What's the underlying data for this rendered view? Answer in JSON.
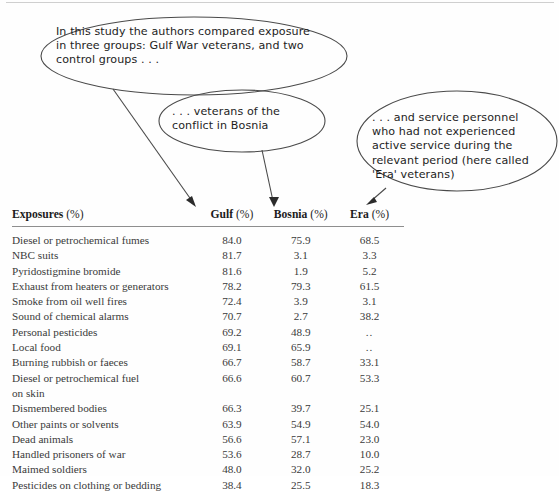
{
  "callouts": [
    {
      "id": "callout-1",
      "name": "callout-gulf-war-veterans",
      "text": "In this study the authors compared exposure\nin three groups: Gulf War veterans, and two\ncontrol groups . . ."
    },
    {
      "id": "callout-2",
      "name": "callout-bosnia-veterans",
      "text": ". . . veterans of the\nconflict in Bosnia"
    },
    {
      "id": "callout-3",
      "name": "callout-era-veterans",
      "text": ". . . and service personnel\nwho had not experienced\nactive service during the\nrelevant period (here called\n'Era' veterans)"
    }
  ],
  "table": {
    "headers": {
      "exposure_label": "Exposures",
      "exposure_unit": "(%)",
      "gulf_label": "Gulf",
      "gulf_unit": "(%)",
      "bosnia_label": "Bosnia",
      "bosnia_unit": "(%)",
      "era_label": "Era",
      "era_unit": "(%)"
    },
    "rows": [
      {
        "label": "Diesel or petrochemical fumes",
        "gulf": "84.0",
        "bosnia": "75.9",
        "era": "68.5"
      },
      {
        "label": "NBC suits",
        "gulf": "81.7",
        "bosnia": "3.1",
        "era": "3.3"
      },
      {
        "label": "Pyridostigmine bromide",
        "gulf": "81.6",
        "bosnia": "1.9",
        "era": "5.2"
      },
      {
        "label": "Exhaust from heaters or generators",
        "gulf": "78.2",
        "bosnia": "79.3",
        "era": "61.5"
      },
      {
        "label": "Smoke from oil well fires",
        "gulf": "72.4",
        "bosnia": "3.9",
        "era": "3.1"
      },
      {
        "label": "Sound of chemical alarms",
        "gulf": "70.7",
        "bosnia": "2.7",
        "era": "38.2"
      },
      {
        "label": "Personal pesticides",
        "gulf": "69.2",
        "bosnia": "48.9",
        "era": ".."
      },
      {
        "label": "Local food",
        "gulf": "69.1",
        "bosnia": "65.9",
        "era": ".."
      },
      {
        "label": "Burning rubbish or faeces",
        "gulf": "66.7",
        "bosnia": "58.7",
        "era": "33.1"
      },
      {
        "label": "Diesel or petrochemical fuel",
        "gulf": "66.6",
        "bosnia": "60.7",
        "era": "53.3"
      },
      {
        "label": "on skin",
        "gulf": "",
        "bosnia": "",
        "era": ""
      },
      {
        "label": "Dismembered bodies",
        "gulf": "66.3",
        "bosnia": "39.7",
        "era": "25.1"
      },
      {
        "label": "Other paints or solvents",
        "gulf": "63.9",
        "bosnia": "54.9",
        "era": "54.0"
      },
      {
        "label": "Dead animals",
        "gulf": "56.6",
        "bosnia": "57.1",
        "era": "23.0"
      },
      {
        "label": "Handled prisoners of war",
        "gulf": "53.6",
        "bosnia": "28.7",
        "era": "10.0"
      },
      {
        "label": "Maimed soldiers",
        "gulf": "48.0",
        "bosnia": "32.0",
        "era": "25.2"
      },
      {
        "label": "Pesticides on clothing or bedding",
        "gulf": "38.4",
        "bosnia": "25.5",
        "era": "18.3"
      }
    ]
  },
  "colors": {
    "ink": "#2b2b2b",
    "rule": "#8e8e8e",
    "annotation_stroke": "#4a4a4a",
    "page_background": "#fefefe"
  }
}
